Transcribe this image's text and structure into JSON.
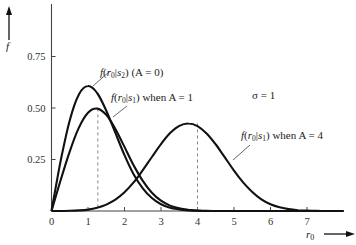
{
  "chart_data": {
    "type": "line",
    "title": "",
    "xlabel": "r0",
    "ylabel": "f",
    "xlim": [
      0,
      8
    ],
    "ylim": [
      0,
      1.0
    ],
    "grid": false,
    "legend": "none (inline annotations)",
    "x_ticks": [
      "0",
      "1",
      "2",
      "3",
      "4",
      "5",
      "6",
      "7"
    ],
    "y_ticks": [
      "0.25",
      "0.50",
      "0.75"
    ],
    "x": [
      0,
      0.25,
      0.5,
      0.75,
      1,
      1.25,
      1.5,
      1.75,
      2,
      2.25,
      2.5,
      2.75,
      3,
      3.25,
      3.5,
      3.75,
      4,
      4.25,
      4.5,
      4.75,
      5,
      5.25,
      5.5,
      5.75,
      6,
      6.25,
      6.5,
      6.75,
      7,
      7.25,
      7.5,
      7.75,
      8
    ],
    "series": [
      {
        "name": "f(r0|s2) (A = 0)",
        "values": [
          0,
          0.242,
          0.441,
          0.566,
          0.607,
          0.573,
          0.487,
          0.379,
          0.271,
          0.178,
          0.11,
          0.063,
          0.033,
          0.016,
          0.008,
          0.003,
          0.001,
          0,
          0,
          0,
          0,
          0,
          0,
          0,
          0,
          0,
          0,
          0,
          0,
          0,
          0,
          0,
          0
        ]
      },
      {
        "name": "f(r0|s1) when A = 1",
        "values": [
          0,
          0.149,
          0.29,
          0.405,
          0.477,
          0.497,
          0.467,
          0.398,
          0.311,
          0.222,
          0.146,
          0.089,
          0.05,
          0.026,
          0.013,
          0.006,
          0.002,
          0.001,
          0,
          0,
          0,
          0,
          0,
          0,
          0,
          0,
          0,
          0,
          0,
          0,
          0,
          0,
          0
        ]
      },
      {
        "name": "f(r0|s1) when A = 4",
        "values": [
          0,
          0.0001,
          0.0008,
          0.003,
          0.007,
          0.016,
          0.031,
          0.055,
          0.091,
          0.139,
          0.198,
          0.262,
          0.325,
          0.378,
          0.413,
          0.425,
          0.412,
          0.376,
          0.323,
          0.26,
          0.196,
          0.139,
          0.092,
          0.057,
          0.033,
          0.018,
          0.009,
          0.004,
          0.002,
          0.001,
          0,
          0,
          0
        ]
      }
    ],
    "reference_lines": [
      {
        "type": "vertical-dashed",
        "x": 1.27,
        "label": "peak A=1"
      },
      {
        "type": "vertical-dashed",
        "x": 4.0,
        "label": "peak A=4"
      }
    ],
    "annotations": [
      {
        "text": "f(r0|s2) (A = 0)",
        "points_to": "A=0 curve"
      },
      {
        "text": "f(r0|s1) when A = 1",
        "points_to": "A=1 curve"
      },
      {
        "text": "σ = 1",
        "type": "parameter"
      },
      {
        "text": "f(r0|s1) when A = 4",
        "points_to": "A=4 curve"
      }
    ]
  },
  "labels": {
    "y_axis": "f",
    "x_axis": "r",
    "x_axis_sub": "0",
    "sigma": "σ = 1",
    "ann_a0": {
      "f": "f",
      "open": "(",
      "r": "r",
      "r_sub": "0",
      "bar": "|",
      "s": "s",
      "s_sub": "2",
      "close": ")",
      "cond": " (A = 0)"
    },
    "ann_a1": {
      "f": "f",
      "open": "(",
      "r": "r",
      "r_sub": "0",
      "bar": "|",
      "s": "s",
      "s_sub": "1",
      "close": ")",
      "cond": " when A = 1"
    },
    "ann_a4": {
      "f": "f",
      "open": "(",
      "r": "r",
      "r_sub": "0",
      "bar": "|",
      "s": "s",
      "s_sub": "1",
      "close": ")",
      "cond": " when A = 4"
    }
  },
  "colors": {
    "curve": "#111111",
    "axis": "#333333",
    "dashed": "#777777"
  }
}
